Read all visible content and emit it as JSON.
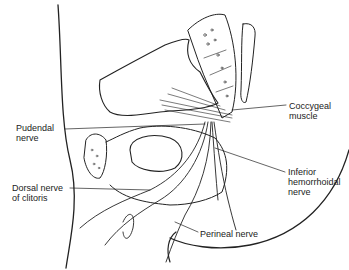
{
  "figure": {
    "type": "anatomical line drawing",
    "stroke_color": "#222222",
    "background": "#ffffff"
  },
  "labels": [
    {
      "id": "coccygeal-muscle",
      "text": "Coccygeal\nmuscle",
      "x": 289,
      "y": 101
    },
    {
      "id": "pudendal-nerve",
      "text": "Pudendal\nnerve",
      "x": 16,
      "y": 123
    },
    {
      "id": "inferior-hemorrhoidal-nerve",
      "text": "Inferior\nhemorrhoidal\nnerve",
      "x": 288,
      "y": 167
    },
    {
      "id": "dorsal-nerve-of-clitoris",
      "text": "Dorsal nerve\nof clitoris",
      "x": 12,
      "y": 183
    },
    {
      "id": "perineal-nerve",
      "text": "Perineal nerve",
      "x": 200,
      "y": 229
    }
  ]
}
